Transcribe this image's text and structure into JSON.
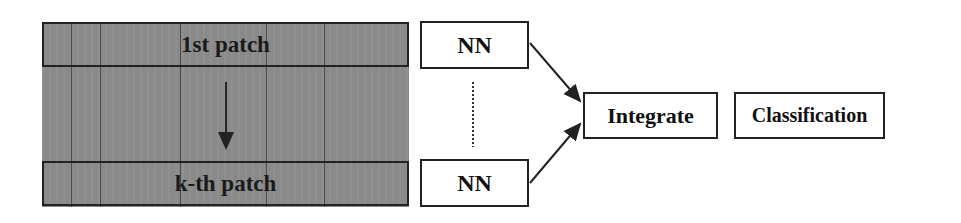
{
  "diagram": {
    "patches": [
      {
        "label": "1st patch"
      },
      {
        "label": "k-th patch"
      }
    ],
    "nn_boxes": [
      {
        "label": "NN"
      },
      {
        "label": "NN"
      }
    ],
    "integrate": {
      "label": "Integrate"
    },
    "classification": {
      "label": "Classification"
    },
    "colors": {
      "band": "#8a8a8a",
      "stroke": "#222222"
    }
  }
}
